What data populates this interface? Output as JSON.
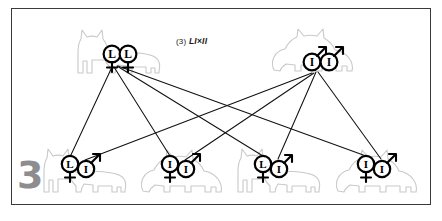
{
  "figure": {
    "number": "3",
    "title_prefix": "(3)",
    "title_cross": "LI×II",
    "title_full": "(3) LI×II",
    "title_left_allele": "LI",
    "title_operator": "×",
    "title_right_allele": "II",
    "border_color": "#3a3a3c",
    "background_color": "#ffffff",
    "number_color": "#8d8d8f",
    "cat_outline_color": "#c9c9cb",
    "symbol_color": "#000000",
    "line_color": "#111111"
  },
  "parents": [
    {
      "id": "parent-left",
      "role": "mother",
      "coat": "shorthair",
      "facing": "left",
      "genotype": "LL",
      "sex": "female",
      "sex_symbol": "♀",
      "alleles": [
        {
          "letter": "L",
          "sex_symbol": "♀",
          "sex": "female"
        },
        {
          "letter": "L",
          "sex_symbol": "♀",
          "sex": "female"
        }
      ]
    },
    {
      "id": "parent-right",
      "role": "father",
      "coat": "longhair",
      "facing": "right",
      "genotype": "II",
      "sex": "male",
      "sex_symbol": "♂",
      "alleles": [
        {
          "letter": "I",
          "sex_symbol": "♂",
          "sex": "male"
        },
        {
          "letter": "I",
          "sex_symbol": "♂",
          "sex": "male"
        }
      ]
    }
  ],
  "offspring": [
    {
      "id": "offspring-1",
      "index": 1,
      "coat": "shorthair",
      "genotype": "LI",
      "alleles": [
        {
          "letter": "L",
          "sex_symbol": "♀",
          "sex": "female",
          "from": "parent-left"
        },
        {
          "letter": "I",
          "sex_symbol": "♂",
          "sex": "male",
          "from": "parent-right"
        }
      ]
    },
    {
      "id": "offspring-2",
      "index": 2,
      "coat": "longhair",
      "genotype": "II",
      "alleles": [
        {
          "letter": "I",
          "sex_symbol": "♀",
          "sex": "female",
          "from": "parent-left"
        },
        {
          "letter": "I",
          "sex_symbol": "♂",
          "sex": "male",
          "from": "parent-right"
        }
      ]
    },
    {
      "id": "offspring-3",
      "index": 3,
      "coat": "shorthair",
      "genotype": "LI",
      "alleles": [
        {
          "letter": "L",
          "sex_symbol": "♀",
          "sex": "female",
          "from": "parent-left"
        },
        {
          "letter": "I",
          "sex_symbol": "♂",
          "sex": "male",
          "from": "parent-right"
        }
      ]
    },
    {
      "id": "offspring-4",
      "index": 4,
      "coat": "longhair",
      "genotype": "II",
      "alleles": [
        {
          "letter": "I",
          "sex_symbol": "♀",
          "sex": "female",
          "from": "parent-left"
        },
        {
          "letter": "I",
          "sex_symbol": "♂",
          "sex": "male",
          "from": "parent-right"
        }
      ]
    }
  ],
  "inheritance_lines": [
    {
      "from": "parent-left",
      "to": "offspring-1"
    },
    {
      "from": "parent-left",
      "to": "offspring-2"
    },
    {
      "from": "parent-left",
      "to": "offspring-3"
    },
    {
      "from": "parent-left",
      "to": "offspring-4"
    },
    {
      "from": "parent-right",
      "to": "offspring-1"
    },
    {
      "from": "parent-right",
      "to": "offspring-2"
    },
    {
      "from": "parent-right",
      "to": "offspring-3"
    },
    {
      "from": "parent-right",
      "to": "offspring-4"
    }
  ]
}
